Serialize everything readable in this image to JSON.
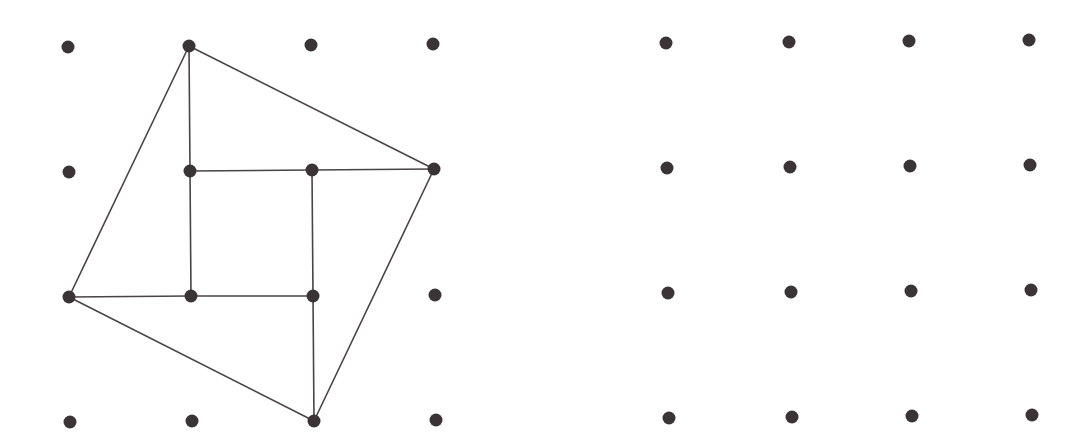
{
  "colors": {
    "dot": "#3a3436",
    "line": "#4a4446",
    "background": "#ffffff"
  },
  "dot_radius": 6.5,
  "line_width": 1.6,
  "grids": [
    {
      "name": "left-geoboard",
      "points": [
        [
          [
            68,
            47
          ],
          [
            189,
            46
          ],
          [
            311,
            45
          ],
          [
            433,
            44
          ]
        ],
        [
          [
            69,
            172
          ],
          [
            190,
            171
          ],
          [
            312,
            170
          ],
          [
            434,
            169
          ]
        ],
        [
          [
            69,
            297
          ],
          [
            191,
            296
          ],
          [
            313,
            296
          ],
          [
            435,
            295
          ]
        ],
        [
          [
            70,
            422
          ],
          [
            192,
            421
          ],
          [
            314,
            421
          ],
          [
            436,
            420
          ]
        ]
      ]
    },
    {
      "name": "right-geoboard",
      "points": [
        [
          [
            666,
            43
          ],
          [
            789,
            42
          ],
          [
            909,
            41
          ],
          [
            1029,
            40
          ]
        ],
        [
          [
            667,
            168
          ],
          [
            790,
            167
          ],
          [
            910,
            166
          ],
          [
            1030,
            165
          ]
        ],
        [
          [
            668,
            293
          ],
          [
            791,
            292
          ],
          [
            911,
            291
          ],
          [
            1031,
            290
          ]
        ],
        [
          [
            669,
            418
          ],
          [
            792,
            417
          ],
          [
            912,
            416
          ],
          [
            1032,
            415
          ]
        ]
      ]
    }
  ],
  "segments": [
    {
      "name": "outer-square-top-right",
      "from": [
        189,
        46
      ],
      "to": [
        434,
        169
      ]
    },
    {
      "name": "outer-square-right-bottom",
      "from": [
        434,
        169
      ],
      "to": [
        314,
        421
      ]
    },
    {
      "name": "outer-square-bottom-left",
      "from": [
        314,
        421
      ],
      "to": [
        69,
        297
      ]
    },
    {
      "name": "outer-square-left-top",
      "from": [
        69,
        297
      ],
      "to": [
        189,
        46
      ]
    },
    {
      "name": "inner-vertical-left-upper",
      "from": [
        189,
        46
      ],
      "to": [
        190,
        171
      ]
    },
    {
      "name": "inner-vertical-left",
      "from": [
        190,
        171
      ],
      "to": [
        191,
        296
      ]
    },
    {
      "name": "inner-horizontal-top",
      "from": [
        190,
        171
      ],
      "to": [
        312,
        170
      ]
    },
    {
      "name": "inner-horizontal-top-extension",
      "from": [
        312,
        170
      ],
      "to": [
        434,
        169
      ]
    },
    {
      "name": "inner-vertical-right",
      "from": [
        312,
        170
      ],
      "to": [
        313,
        296
      ]
    },
    {
      "name": "inner-vertical-right-lower",
      "from": [
        313,
        296
      ],
      "to": [
        314,
        421
      ]
    },
    {
      "name": "inner-horizontal-bottom",
      "from": [
        191,
        296
      ],
      "to": [
        313,
        296
      ]
    },
    {
      "name": "inner-horizontal-bottom-extension",
      "from": [
        69,
        297
      ],
      "to": [
        191,
        296
      ]
    }
  ]
}
